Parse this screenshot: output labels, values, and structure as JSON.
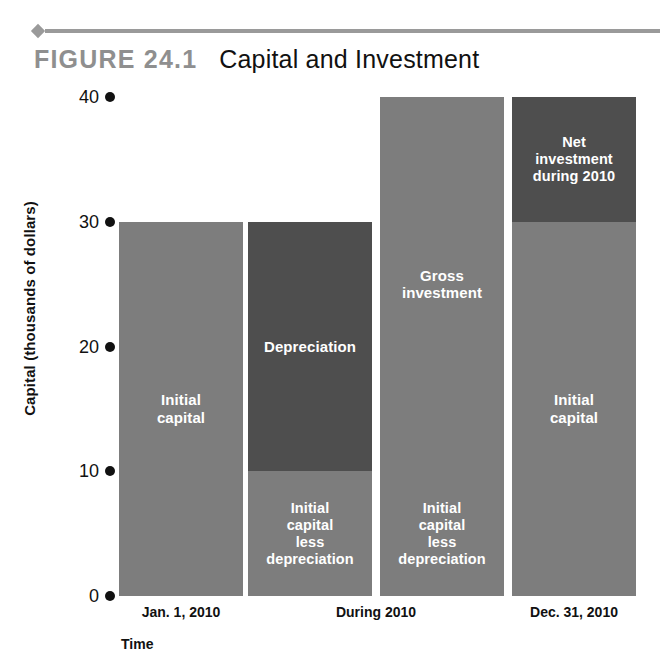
{
  "header": {
    "figure_number": "FIGURE  24.1",
    "figure_title": "Capital and Investment"
  },
  "chart_data": {
    "type": "bar",
    "title": "Capital and Investment",
    "xlabel": "Time",
    "ylabel": "Capital (thousands of dollars)",
    "ylim": [
      0,
      40
    ],
    "yticks": [
      "0",
      "10",
      "20",
      "30",
      "40"
    ],
    "ytick_values": [
      0,
      10,
      20,
      30,
      40
    ],
    "grid": false,
    "legend": "none",
    "categories": [
      "Jan. 1, 2010",
      "During 2010",
      "Dec. 31, 2010"
    ],
    "bars": [
      {
        "id": "bar-jan-1-2010",
        "category": "Jan. 1, 2010",
        "total": 30,
        "segments": [
          {
            "label": "Initial\ncapital",
            "from": 0,
            "to": 30,
            "shade": "light"
          }
        ]
      },
      {
        "id": "bar-during-2010-depreciation",
        "category": "During 2010",
        "total": 30,
        "segments": [
          {
            "label": "Initial\ncapital\nless\ndepreciation",
            "from": 0,
            "to": 10,
            "shade": "light"
          },
          {
            "label": "Depreciation",
            "from": 10,
            "to": 30,
            "shade": "dark"
          }
        ]
      },
      {
        "id": "bar-during-2010-gross-investment",
        "category": "During 2010",
        "total": 40,
        "segments": [
          {
            "label": "Initial\ncapital\nless\ndepreciation",
            "from": 0,
            "to": 10,
            "shade": "light"
          },
          {
            "label": "Gross\ninvestment",
            "from": 10,
            "to": 40,
            "shade": "light"
          }
        ]
      },
      {
        "id": "bar-dec-31-2010",
        "category": "Dec. 31, 2010",
        "total": 40,
        "segments": [
          {
            "label": "Initial\ncapital",
            "from": 0,
            "to": 30,
            "shade": "light"
          },
          {
            "label": "Net\ninvestment\nduring 2010",
            "from": 30,
            "to": 40,
            "shade": "dark"
          }
        ]
      }
    ],
    "annotations": [
      "Initial capital",
      "Depreciation",
      "Initial capital less depreciation",
      "Gross investment",
      "Net investment during 2010"
    ],
    "colors": {
      "light_fill": "#7d7d7d",
      "dark_fill": "#4e4e4e",
      "rule": "#9a9a9a",
      "figure_number": "#8f8f8f",
      "text": "#111111",
      "bar_label_text": "#ffffff"
    }
  }
}
